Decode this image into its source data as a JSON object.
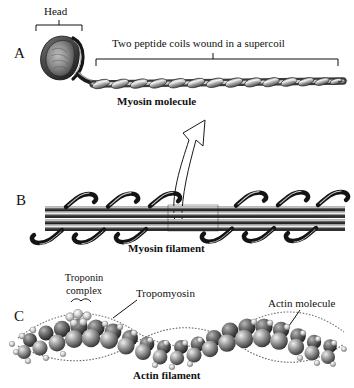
{
  "figure": {
    "background_color": "#ffffff",
    "ink_color": "#111111",
    "style": "grayscale scientific textbook illustration"
  },
  "panels": [
    {
      "letter": "A",
      "subject": "myosin-molecule",
      "caption": "Myosin molecule",
      "annotations": [
        {
          "name": "head-bracket-label",
          "text": "Head",
          "bracket": "down"
        },
        {
          "name": "supercoil-bracket-label",
          "text": "Two peptide coils wound in a supercoil",
          "bracket": "down"
        }
      ]
    },
    {
      "letter": "B",
      "subject": "myosin-filament",
      "caption": "Myosin filament",
      "annotations": []
    },
    {
      "letter": "C",
      "subject": "actin-filament",
      "caption": "Actin filament",
      "annotations": [
        {
          "name": "troponin-complex-label",
          "text_line1": "Troponin",
          "text_line2": "complex",
          "bracket": "down"
        },
        {
          "name": "tropomyosin-label",
          "text": "Tropomyosin",
          "leader": "down-left"
        },
        {
          "name": "actin-molecule-label",
          "text": "Actin molecule",
          "leader": "down-left"
        }
      ]
    }
  ],
  "connector": {
    "name": "magnification-arrow",
    "from_panel": "B",
    "to_panel": "A",
    "style": "hollow outlined curved arrow pointing up"
  }
}
